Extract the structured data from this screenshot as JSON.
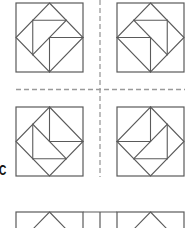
{
  "figure": {
    "label": "C",
    "line_color": "#5a5a5a",
    "dash_color": "#9a9a9a",
    "blocks": [
      {
        "id": "top-left",
        "row": 1,
        "col": 1
      },
      {
        "id": "top-right",
        "row": 1,
        "col": 2
      },
      {
        "id": "middle-left",
        "row": 2,
        "col": 1
      },
      {
        "id": "middle-right",
        "row": 2,
        "col": 2
      },
      {
        "id": "bottom-left",
        "row": 3,
        "col": 1,
        "partial": true
      },
      {
        "id": "bottom-right",
        "row": 3,
        "col": 2,
        "partial": true
      }
    ]
  }
}
